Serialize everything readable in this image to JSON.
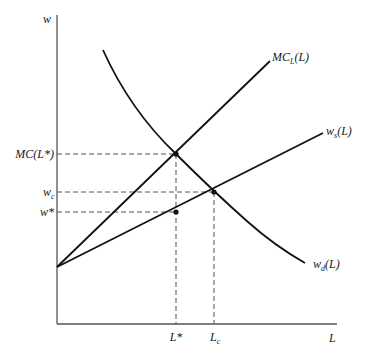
{
  "diagram": {
    "axes": {
      "y_label": "w",
      "x_label": "L"
    },
    "curves": {
      "mc": {
        "label_main": "MC",
        "label_sub": "L",
        "label_tail": "(L)"
      },
      "supply": {
        "label_main": "w",
        "label_sub": "s",
        "label_tail": "(L)"
      },
      "demand": {
        "label_main": "w",
        "label_sub": "d",
        "label_tail": "(L)"
      }
    },
    "y_ticks": {
      "mc_lstar": "MC(L*)",
      "wc_main": "w",
      "wc_sub": "c",
      "wstar": "w*"
    },
    "x_ticks": {
      "lstar": "L*",
      "lc_main": "L",
      "lc_sub": "c"
    },
    "colors": {
      "curve": "#111111",
      "axis": "#555555",
      "dash": "#555555"
    }
  }
}
